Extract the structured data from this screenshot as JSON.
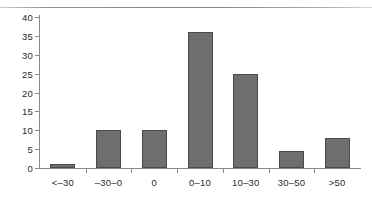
{
  "chart_data": {
    "type": "bar",
    "title": "",
    "subtitle": "",
    "xlabel": "",
    "ylabel": "",
    "categories": [
      "<–30",
      "–30–0",
      "0",
      "0–10",
      "10–30",
      "30–50",
      ">50"
    ],
    "values": [
      1,
      10,
      10,
      36,
      25,
      4.5,
      8
    ],
    "ylim": [
      0,
      40
    ],
    "y_ticks": [
      0,
      5,
      10,
      15,
      20,
      25,
      30,
      35,
      40
    ],
    "y_tick_labels": [
      "0",
      "5",
      "10",
      "15",
      "20",
      "25",
      "30",
      "35",
      "40"
    ],
    "grid": false,
    "legend": false,
    "legend_position": "none",
    "series": [
      {
        "name": "",
        "values": [
          1,
          10,
          10,
          36,
          25,
          4.5,
          8
        ]
      }
    ],
    "colors": {
      "bar_fill": "#6e6e6e",
      "bar_stroke": "#4a4a4a",
      "axis": "#8a8a8a",
      "text": "#2b2b2b",
      "background": "#ffffff"
    }
  }
}
